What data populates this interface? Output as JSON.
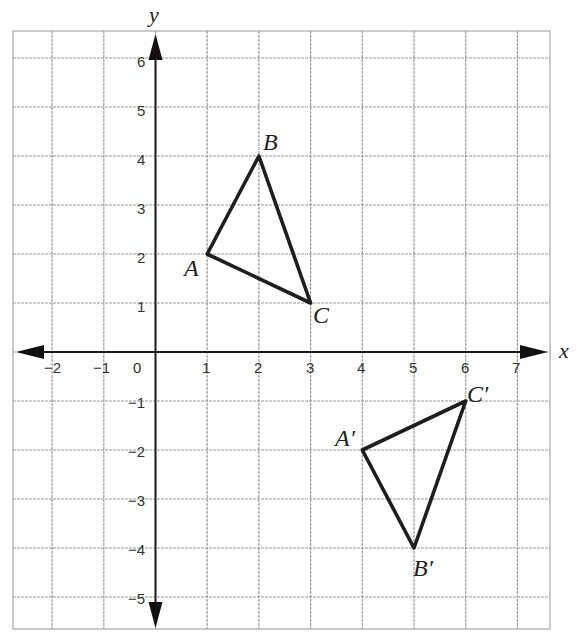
{
  "chart_data": {
    "type": "coordinate-grid",
    "xlabel": "x",
    "ylabel": "y",
    "x_ticks": [
      "−2",
      "−1",
      "0",
      "1",
      "2",
      "3",
      "4",
      "5",
      "6",
      "7"
    ],
    "y_ticks": [
      "6",
      "5",
      "4",
      "3",
      "2",
      "1",
      "−1",
      "−2",
      "−3",
      "−4",
      "−5"
    ],
    "xlim": [
      -2.75,
      7.6
    ],
    "ylim": [
      -5.65,
      6.55
    ],
    "grid": true,
    "triangles": [
      {
        "name": "ABC",
        "vertices": [
          {
            "label": "A",
            "x": 1,
            "y": 2
          },
          {
            "label": "B",
            "x": 2,
            "y": 4
          },
          {
            "label": "C",
            "x": 3,
            "y": 1
          }
        ]
      },
      {
        "name": "A'B'C'",
        "vertices": [
          {
            "label": "A′",
            "x": 4,
            "y": -2
          },
          {
            "label": "B′",
            "x": 5,
            "y": -4
          },
          {
            "label": "C′",
            "x": 6,
            "y": -1
          }
        ]
      }
    ]
  },
  "labels": {
    "x_axis": "x",
    "y_axis": "y",
    "A": "A",
    "B": "B",
    "C": "C",
    "A_prime": "A′",
    "B_prime": "B′",
    "C_prime": "C′"
  },
  "colors": {
    "grid": "#9a9a9a",
    "axis": "#1a1a1a",
    "triangle": "#1e1e1e"
  }
}
